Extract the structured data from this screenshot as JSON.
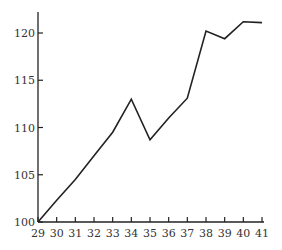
{
  "chart_data": {
    "type": "line",
    "title": "",
    "xlabel": "",
    "ylabel": "",
    "x": [
      29,
      30,
      31,
      32,
      33,
      34,
      35,
      36,
      37,
      38,
      39,
      40,
      41
    ],
    "series": [
      {
        "name": "series",
        "values": [
          100,
          102.3,
          104.5,
          107,
          109.5,
          113,
          108.7,
          111,
          113.1,
          120.2,
          119.4,
          121.2,
          121.1
        ]
      }
    ],
    "xlim": [
      29,
      41
    ],
    "ylim": [
      100,
      122
    ],
    "xticks": [
      "29",
      "30",
      "31",
      "32",
      "33",
      "34",
      "35",
      "36",
      "37",
      "38",
      "39",
      "40",
      "41"
    ],
    "yticks": [
      "100",
      "105",
      "110",
      "115",
      "120"
    ],
    "grid": false,
    "legend": null,
    "line_color": "#222222"
  }
}
